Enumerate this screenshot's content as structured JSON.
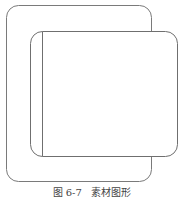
{
  "figure": {
    "caption_number": "图 6-7",
    "caption_title": "素材图形",
    "stroke_color": "#7a7a7a",
    "fill_color": "#ffffff"
  },
  "shapes": [
    {
      "name": "outer-rounded-rectangle",
      "x": 6,
      "y": 5,
      "width": 145,
      "height": 176,
      "radius": 12
    },
    {
      "name": "inner-rounded-rectangle",
      "x": 30,
      "y": 31,
      "width": 147,
      "height": 125,
      "radius": 12
    },
    {
      "name": "inner-vertical-line",
      "x1": 42,
      "y1": 31,
      "x2": 42,
      "y2": 156
    }
  ]
}
